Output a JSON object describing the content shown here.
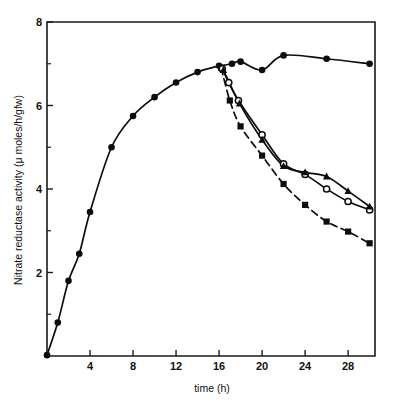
{
  "figure": {
    "title": "",
    "xaxis_label": "time (h)",
    "yaxis_label": "Nitrate reductase activity (μ moles/h/gfw)"
  },
  "chart_data": {
    "type": "line",
    "title": "",
    "xlabel": "time (h)",
    "ylabel": "Nitrate reductase activity (μ moles/h/gfw)",
    "xlim": [
      0,
      30.5
    ],
    "ylim": [
      0,
      8
    ],
    "xticks": [
      4,
      8,
      12,
      16,
      20,
      24,
      28
    ],
    "xticklabels": [
      "4",
      "8",
      "12",
      "16",
      "20",
      "24",
      "28"
    ],
    "xticks_minor": [
      2,
      6,
      10,
      14,
      18,
      22,
      26,
      30
    ],
    "yticks": [
      2,
      4,
      6,
      8
    ],
    "yticklabels": [
      "2",
      "4",
      "6",
      "8"
    ],
    "yticks_minor": [
      1,
      3,
      5,
      7
    ],
    "grid": false,
    "legend": "none",
    "series": [
      {
        "name": "control",
        "marker": "filled-circle",
        "line": "solid-dashed",
        "points": [
          [
            0.0,
            0.02
          ],
          [
            1.0,
            0.8
          ],
          [
            2.0,
            1.8
          ],
          [
            3.0,
            2.45
          ],
          [
            4.0,
            3.45
          ],
          [
            6.0,
            5.0
          ],
          [
            8.0,
            5.75
          ],
          [
            10.0,
            6.2
          ],
          [
            12.0,
            6.55
          ],
          [
            14.0,
            6.8
          ],
          [
            16.0,
            6.95
          ],
          [
            17.2,
            7.0
          ],
          [
            18.0,
            7.05
          ],
          [
            20.0,
            6.85
          ],
          [
            22.0,
            7.2
          ],
          [
            26.0,
            7.12
          ],
          [
            30.0,
            7.0
          ]
        ]
      },
      {
        "name": "treatment-squares",
        "marker": "filled-square",
        "line": "dashed",
        "points": [
          [
            16.2,
            6.9
          ],
          [
            17.0,
            6.12
          ],
          [
            18.0,
            5.5
          ],
          [
            20.0,
            4.8
          ],
          [
            22.0,
            4.12
          ],
          [
            24.0,
            3.62
          ],
          [
            26.0,
            3.22
          ],
          [
            28.0,
            2.98
          ],
          [
            30.0,
            2.7
          ]
        ]
      },
      {
        "name": "treatment-open-circles",
        "marker": "open-circle",
        "line": "solid",
        "points": [
          [
            16.3,
            6.88
          ],
          [
            16.9,
            6.55
          ],
          [
            17.8,
            6.12
          ],
          [
            20.0,
            5.3
          ],
          [
            22.0,
            4.6
          ],
          [
            24.0,
            4.35
          ],
          [
            26.0,
            4.0
          ],
          [
            28.0,
            3.7
          ],
          [
            30.0,
            3.5
          ]
        ]
      },
      {
        "name": "treatment-filled-triangles",
        "marker": "filled-triangle",
        "line": "solid",
        "points": [
          [
            16.4,
            6.85
          ],
          [
            17.9,
            6.05
          ],
          [
            20.0,
            5.18
          ],
          [
            22.0,
            4.55
          ],
          [
            24.0,
            4.4
          ],
          [
            26.0,
            4.3
          ],
          [
            28.0,
            3.95
          ],
          [
            30.0,
            3.58
          ]
        ]
      }
    ]
  }
}
